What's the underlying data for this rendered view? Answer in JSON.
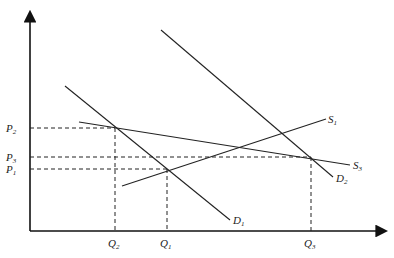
{
  "diagram": {
    "type": "supply-demand",
    "axes": {
      "x": {
        "from": [
          30,
          231
        ],
        "to": [
          385,
          231
        ]
      },
      "y": {
        "from": [
          30,
          231
        ],
        "to": [
          30,
          13
        ]
      }
    },
    "curves": [
      {
        "id": "D1",
        "base": "D",
        "sub": "1",
        "x1": 65,
        "y1": 86,
        "x2": 230,
        "y2": 220,
        "label_x": 233,
        "label_y": 224
      },
      {
        "id": "D2",
        "base": "D",
        "sub": "2",
        "x1": 161,
        "y1": 30,
        "x2": 333,
        "y2": 177,
        "label_x": 336,
        "label_y": 182
      },
      {
        "id": "S1",
        "base": "S",
        "sub": "1",
        "x1": 122,
        "y1": 186,
        "x2": 326,
        "y2": 119,
        "label_x": 328,
        "label_y": 123
      },
      {
        "id": "S3",
        "base": "S",
        "sub": "3",
        "x1": 79,
        "y1": 122,
        "x2": 350,
        "y2": 165,
        "label_x": 353,
        "label_y": 169
      }
    ],
    "price_levels": [
      {
        "id": "P2",
        "base": "P",
        "sub": "2",
        "y": 128,
        "x_end": 115
      },
      {
        "id": "P3",
        "base": "P",
        "sub": "3",
        "y": 157,
        "x_end": 311
      },
      {
        "id": "P1",
        "base": "P",
        "sub": "1",
        "y": 169,
        "x_end": 167
      }
    ],
    "quantity_levels": [
      {
        "id": "Q2",
        "base": "Q",
        "sub": "2",
        "x": 115,
        "y_start": 128
      },
      {
        "id": "Q1",
        "base": "Q",
        "sub": "1",
        "x": 167,
        "y_start": 169
      },
      {
        "id": "Q3",
        "base": "Q",
        "sub": "3",
        "x": 311,
        "y_start": 157
      }
    ]
  }
}
